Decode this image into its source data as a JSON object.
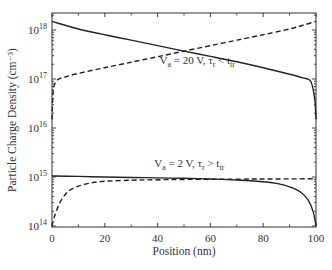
{
  "chart_data": {
    "type": "line",
    "title": "",
    "xlabel": "Position (nm)",
    "ylabel": "Particle Charge Density (cm⁻³)",
    "xlim": [
      0,
      100
    ],
    "ylim": [
      100000000000000.0,
      2.2e+18
    ],
    "yscale": "log",
    "xticks": [
      0,
      20,
      40,
      60,
      80,
      100
    ],
    "xtick_labels": [
      "0",
      "20",
      "40",
      "60",
      "80",
      "100"
    ],
    "yticks": [
      100000000000000.0,
      1000000000000000.0,
      1e+16,
      1e+17,
      1e+18
    ],
    "ytick_labels": [
      {
        "base": "10",
        "exp": "14"
      },
      {
        "base": "10",
        "exp": "15"
      },
      {
        "base": "10",
        "exp": "16"
      },
      {
        "base": "10",
        "exp": "17"
      },
      {
        "base": "10",
        "exp": "18"
      }
    ],
    "grid": false,
    "legend": "none (inline annotations)",
    "annotations": [
      {
        "text_parts": [
          "V",
          "a",
          " = 20 V, τ",
          "r",
          " < t",
          "tr"
        ],
        "x": 55,
        "y": 2e+17
      },
      {
        "text_parts": [
          "V",
          "a",
          " = 2 V, τ",
          "r",
          " > t",
          "tr"
        ],
        "x": 52,
        "y": 1600000000000000.0
      }
    ],
    "series": [
      {
        "name": "Va = 20 V, solid (carrier 1)",
        "style": "solid",
        "x": [
          0,
          5,
          10,
          20,
          30,
          40,
          50,
          60,
          70,
          80,
          90,
          95,
          98,
          99.5,
          100
        ],
        "y": [
          1.5e+18,
          1.25e+18,
          1.05e+18,
          8e+17,
          6.2e+17,
          4.8e+17,
          3.7e+17,
          2.9e+17,
          2.25e+17,
          1.7e+17,
          1.25e+17,
          1.05e+17,
          9e+16,
          4e+16,
          1.5e+16
        ]
      },
      {
        "name": "Va = 20 V, dashed (carrier 2)",
        "style": "dashed",
        "x": [
          0,
          0.5,
          2,
          5,
          10,
          20,
          30,
          40,
          50,
          60,
          70,
          80,
          90,
          95,
          100
        ],
        "y": [
          1.5e+16,
          6e+16,
          9.5e+16,
          1.1e+17,
          1.3e+17,
          1.7e+17,
          2.2e+17,
          2.85e+17,
          3.7e+17,
          4.8e+17,
          6.2e+17,
          8e+17,
          1.05e+18,
          1.25e+18,
          1.5e+18
        ]
      },
      {
        "name": "Va = 2 V, solid (carrier 1)",
        "style": "solid",
        "x": [
          0,
          10,
          20,
          30,
          40,
          50,
          60,
          70,
          80,
          85,
          90,
          94,
          97,
          99,
          100
        ],
        "y": [
          1050000000000000.0,
          1030000000000000.0,
          1000000000000000.0,
          980000000000000.0,
          960000000000000.0,
          940000000000000.0,
          910000000000000.0,
          870000000000000.0,
          800000000000000.0,
          740000000000000.0,
          630000000000000.0,
          500000000000000.0,
          340000000000000.0,
          190000000000000.0,
          100000000000000.0
        ]
      },
      {
        "name": "Va = 2 V, dashed (carrier 2)",
        "style": "dashed",
        "x": [
          0,
          1,
          3,
          6,
          10,
          15,
          20,
          30,
          40,
          60,
          80,
          100
        ],
        "y": [
          100000000000000.0,
          160000000000000.0,
          300000000000000.0,
          500000000000000.0,
          650000000000000.0,
          760000000000000.0,
          820000000000000.0,
          860000000000000.0,
          880000000000000.0,
          900000000000000.0,
          910000000000000.0,
          920000000000000.0
        ]
      }
    ]
  }
}
